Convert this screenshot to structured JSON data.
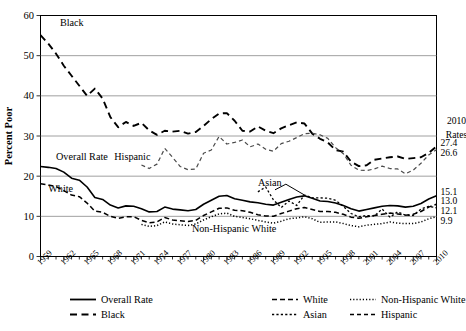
{
  "chart_data": {
    "type": "line",
    "title": "",
    "xlabel": "",
    "ylabel": "Percent Poor",
    "ylim": [
      0,
      60
    ],
    "yticks": [
      0,
      10,
      20,
      30,
      40,
      50,
      60
    ],
    "xlim": [
      1959,
      2010
    ],
    "xticks": [
      1959,
      1962,
      1965,
      1968,
      1971,
      1974,
      1977,
      1980,
      1983,
      1986,
      1989,
      1992,
      1995,
      1998,
      2001,
      2004,
      2007,
      2010
    ],
    "grid": "horizontal",
    "legend_position": "below-axes",
    "right_panel": {
      "header_line1": "2010",
      "header_line2": "Rates",
      "values": [
        {
          "label": "27.4",
          "series": "Black"
        },
        {
          "label": "26.6",
          "series": "Hispanic"
        },
        {
          "label": "15.1",
          "series": "Overall Rate"
        },
        {
          "label": "13.0",
          "series": "White"
        },
        {
          "label": "12.1",
          "series": "Asian"
        },
        {
          "label": "9.9",
          "series": "Non-Hispanic White"
        }
      ]
    },
    "inline_annotations": [
      {
        "text": "Black",
        "x": 1961.5,
        "y": 57.5
      },
      {
        "text": "Overall Rate",
        "x": 1961.0,
        "y": 24.0
      },
      {
        "text": "Hispanic",
        "x": 1968.5,
        "y": 24.0
      },
      {
        "text": "White",
        "x": 1960.0,
        "y": 16.0
      },
      {
        "text": "Asian",
        "x": 1987.0,
        "y": 17.5
      },
      {
        "text": "Non-Hispanic White",
        "x": 1978.5,
        "y": 6.2
      }
    ],
    "series": [
      {
        "name": "Overall Rate",
        "style": "solid",
        "x": [
          1959,
          1960,
          1961,
          1962,
          1963,
          1964,
          1965,
          1966,
          1967,
          1968,
          1969,
          1970,
          1971,
          1972,
          1973,
          1974,
          1975,
          1976,
          1977,
          1978,
          1979,
          1980,
          1981,
          1982,
          1983,
          1984,
          1985,
          1986,
          1987,
          1988,
          1989,
          1990,
          1991,
          1992,
          1993,
          1994,
          1995,
          1996,
          1997,
          1998,
          1999,
          2000,
          2001,
          2002,
          2003,
          2004,
          2005,
          2006,
          2007,
          2008,
          2009,
          2010
        ],
        "values": [
          22.4,
          22.2,
          21.9,
          21.0,
          19.5,
          19.0,
          17.3,
          14.7,
          14.2,
          12.8,
          12.1,
          12.6,
          12.5,
          11.9,
          11.1,
          11.2,
          12.3,
          11.8,
          11.6,
          11.4,
          11.7,
          13.0,
          14.0,
          15.0,
          15.2,
          14.4,
          14.0,
          13.6,
          13.4,
          13.0,
          12.8,
          13.5,
          14.2,
          14.8,
          15.1,
          14.5,
          13.8,
          13.7,
          13.3,
          12.7,
          11.9,
          11.3,
          11.7,
          12.1,
          12.5,
          12.7,
          12.6,
          12.3,
          12.5,
          13.2,
          14.3,
          15.1
        ]
      },
      {
        "name": "Black",
        "style": "long-dash",
        "x": [
          1959,
          1960,
          1961,
          1962,
          1963,
          1964,
          1965,
          1966,
          1967,
          1968,
          1969,
          1970,
          1971,
          1972,
          1973,
          1974,
          1975,
          1976,
          1977,
          1978,
          1979,
          1980,
          1981,
          1982,
          1983,
          1984,
          1985,
          1986,
          1987,
          1988,
          1989,
          1990,
          1991,
          1992,
          1993,
          1994,
          1995,
          1996,
          1997,
          1998,
          1999,
          2000,
          2001,
          2002,
          2003,
          2004,
          2005,
          2006,
          2007,
          2008,
          2009,
          2010
        ],
        "values": [
          55.1,
          53.0,
          50.5,
          47.5,
          45.0,
          42.5,
          40.0,
          41.8,
          39.3,
          34.7,
          32.2,
          33.5,
          32.5,
          33.3,
          31.4,
          30.3,
          31.3,
          31.1,
          31.3,
          30.6,
          31.0,
          32.5,
          34.2,
          35.6,
          35.7,
          33.8,
          31.3,
          31.1,
          32.4,
          31.3,
          30.7,
          31.9,
          32.7,
          33.4,
          33.1,
          30.6,
          29.3,
          28.4,
          26.5,
          26.1,
          23.6,
          22.5,
          22.7,
          24.1,
          24.4,
          24.7,
          24.9,
          24.3,
          24.5,
          24.7,
          25.8,
          27.4
        ]
      },
      {
        "name": "White",
        "style": "dash",
        "x": [
          1959,
          1960,
          1961,
          1962,
          1963,
          1964,
          1965,
          1966,
          1967,
          1968,
          1969,
          1970,
          1971,
          1972,
          1973,
          1974,
          1975,
          1976,
          1977,
          1978,
          1979,
          1980,
          1981,
          1982,
          1983,
          1984,
          1985,
          1986,
          1987,
          1988,
          1989,
          1990,
          1991,
          1992,
          1993,
          1994,
          1995,
          1996,
          1997,
          1998,
          1999,
          2000,
          2001,
          2002,
          2003,
          2004,
          2005,
          2006,
          2007,
          2008,
          2009,
          2010
        ],
        "values": [
          18.1,
          17.8,
          17.4,
          16.4,
          15.3,
          14.9,
          13.3,
          11.3,
          11.0,
          10.0,
          9.5,
          9.9,
          9.9,
          9.0,
          8.4,
          8.6,
          9.7,
          9.1,
          8.9,
          8.7,
          9.0,
          10.2,
          11.1,
          12.0,
          12.1,
          11.5,
          11.4,
          11.0,
          10.4,
          10.1,
          10.0,
          10.7,
          11.3,
          11.9,
          12.2,
          11.7,
          11.2,
          11.2,
          11.0,
          10.5,
          9.8,
          9.5,
          9.9,
          10.2,
          10.5,
          10.8,
          10.6,
          10.3,
          10.5,
          11.2,
          12.3,
          13.0
        ]
      },
      {
        "name": "Asian",
        "style": "fine-dash",
        "x": [
          1987,
          1988,
          1989,
          1990,
          1991,
          1992,
          1993,
          1994,
          1995,
          1996,
          1997,
          1998,
          1999,
          2000,
          2001,
          2002,
          2003,
          2004,
          2005,
          2006,
          2007,
          2008,
          2009,
          2010
        ],
        "values": [
          16.1,
          17.3,
          14.1,
          12.2,
          13.8,
          12.7,
          15.3,
          14.6,
          14.6,
          14.5,
          14.0,
          12.5,
          10.7,
          9.9,
          10.2,
          10.1,
          11.8,
          9.8,
          11.1,
          10.3,
          10.2,
          11.8,
          12.5,
          12.1
        ]
      },
      {
        "name": "Non-Hispanic White",
        "style": "dotted",
        "x": [
          1972,
          1973,
          1974,
          1975,
          1976,
          1977,
          1978,
          1979,
          1980,
          1981,
          1982,
          1983,
          1984,
          1985,
          1986,
          1987,
          1988,
          1989,
          1990,
          1991,
          1992,
          1993,
          1994,
          1995,
          1996,
          1997,
          1998,
          1999,
          2000,
          2001,
          2002,
          2003,
          2004,
          2005,
          2006,
          2007,
          2008,
          2009,
          2010
        ],
        "values": [
          8.0,
          7.5,
          7.7,
          8.6,
          8.1,
          7.9,
          7.7,
          8.1,
          9.1,
          9.9,
          10.6,
          10.8,
          10.0,
          9.7,
          9.4,
          9.0,
          8.6,
          8.3,
          8.8,
          9.4,
          9.6,
          9.9,
          9.4,
          8.5,
          8.6,
          8.6,
          8.2,
          7.7,
          7.4,
          7.8,
          8.0,
          8.2,
          8.6,
          8.3,
          8.2,
          8.2,
          8.6,
          9.4,
          9.9
        ]
      },
      {
        "name": "Hispanic",
        "style": "med-dash",
        "x": [
          1972,
          1973,
          1974,
          1975,
          1976,
          1977,
          1978,
          1979,
          1980,
          1981,
          1982,
          1983,
          1984,
          1985,
          1986,
          1987,
          1988,
          1989,
          1990,
          1991,
          1992,
          1993,
          1994,
          1995,
          1996,
          1997,
          1998,
          1999,
          2000,
          2001,
          2002,
          2003,
          2004,
          2005,
          2006,
          2007,
          2008,
          2009,
          2010
        ],
        "values": [
          22.8,
          21.9,
          23.0,
          26.9,
          24.7,
          22.4,
          21.6,
          21.8,
          25.7,
          26.5,
          29.9,
          28.0,
          28.4,
          29.0,
          27.3,
          28.0,
          26.7,
          26.2,
          28.1,
          28.7,
          29.6,
          30.6,
          30.7,
          30.3,
          29.4,
          27.1,
          25.6,
          22.7,
          21.5,
          21.4,
          21.8,
          22.5,
          21.9,
          21.8,
          20.6,
          21.5,
          23.2,
          25.3,
          26.6
        ]
      }
    ]
  },
  "legend": {
    "items": [
      {
        "label": "Overall Rate",
        "style": "solid"
      },
      {
        "label": "White",
        "style": "dash"
      },
      {
        "label": "Non-Hispanic White",
        "style": "dotted"
      },
      {
        "label": "Black",
        "style": "long-dash"
      },
      {
        "label": "Asian",
        "style": "fine-dash"
      },
      {
        "label": "Hispanic",
        "style": "med-dash"
      }
    ]
  },
  "colors": {
    "axis": "#000000",
    "grid": "#888888",
    "background": "#ffffff",
    "hispanic": "#4a4a4a"
  }
}
